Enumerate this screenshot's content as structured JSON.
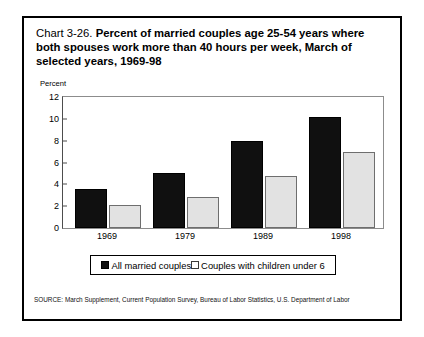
{
  "figure": {
    "title_prefix": "Chart 3-26. ",
    "title": "Percent of married couples age 25-54 years where both spouses work more than 40 hours per week, March of selected years, 1969-98",
    "source": "SOURCE: March Supplement, Current  Population Survey, Bureau of Labor Statistics, U.S. Department of Labor",
    "border_color": "#000000"
  },
  "chart_data": {
    "type": "bar",
    "title": "Chart 3-26. Percent of married couples age 25-54 years where both spouses work more than 40 hours per week, March of selected years, 1969-98",
    "xlabel": "",
    "ylabel": "Percent",
    "categories": [
      "1969",
      "1979",
      "1989",
      "1998"
    ],
    "series": [
      {
        "name": "All married couples",
        "color": "#101010",
        "values": [
          3.6,
          5.0,
          8.0,
          10.2
        ]
      },
      {
        "name": "Couples with children under 6",
        "color": "#e2e2e2",
        "values": [
          2.1,
          2.8,
          4.8,
          7.0
        ]
      }
    ],
    "ylim": [
      0,
      12
    ],
    "yticks": [
      "0",
      "2",
      "4",
      "6",
      "8",
      "10",
      "12"
    ],
    "ytick_values": [
      0,
      2,
      4,
      6,
      8,
      10,
      12
    ],
    "grid": false,
    "legend_position": "bottom"
  }
}
